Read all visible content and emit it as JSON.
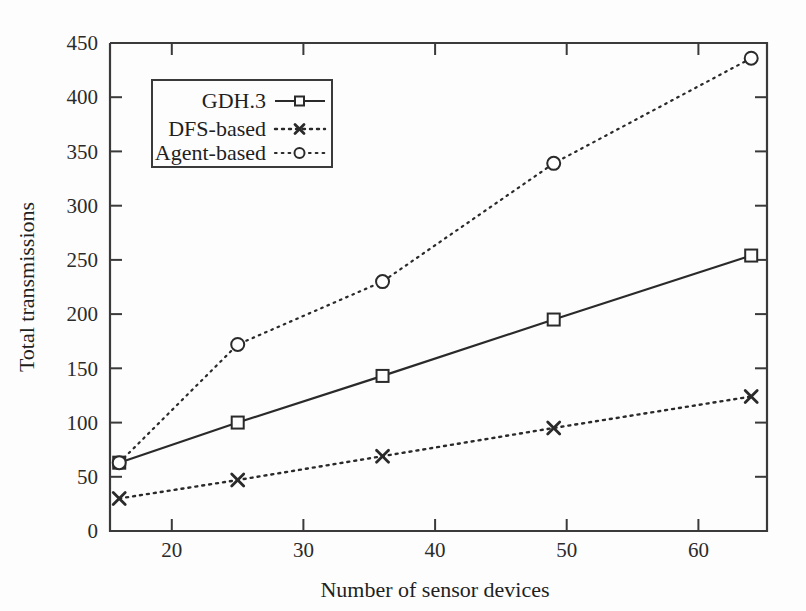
{
  "chart_data": {
    "type": "line",
    "title": "",
    "xlabel": "Number of sensor devices",
    "ylabel": "Total transmissions",
    "xlim": [
      15.3,
      65.2
    ],
    "ylim": [
      0,
      450
    ],
    "xticks": [
      20,
      30,
      40,
      50,
      60
    ],
    "yticks": [
      0,
      50,
      100,
      150,
      200,
      250,
      300,
      350,
      400,
      450
    ],
    "grid": false,
    "legend_position": "upper-left",
    "x": [
      16,
      25,
      36,
      49,
      64
    ],
    "series": [
      {
        "name": "GDH.3",
        "marker": "square",
        "linestyle": "solid",
        "values": [
          63,
          100,
          143,
          195,
          254
        ]
      },
      {
        "name": "DFS-based",
        "marker": "cross",
        "linestyle": "dashed",
        "values": [
          30,
          47,
          69,
          95,
          124
        ]
      },
      {
        "name": "Agent-based",
        "marker": "circle",
        "linestyle": "dotted",
        "values": [
          63,
          172,
          230,
          339,
          436
        ]
      }
    ]
  },
  "axes": {
    "x_label": "Number of sensor devices",
    "y_label": "Total transmissions",
    "x_tick_labels": [
      "20",
      "30",
      "40",
      "50",
      "60"
    ],
    "y_tick_labels": [
      "0",
      "50",
      "100",
      "150",
      "200",
      "250",
      "300",
      "350",
      "400",
      "450"
    ]
  },
  "legend": {
    "entries": [
      {
        "label": "GDH.3"
      },
      {
        "label": "DFS-based"
      },
      {
        "label": "Agent-based"
      }
    ]
  },
  "colors": {
    "ink": "#2a2a2a",
    "background": "#fdfdfd"
  }
}
